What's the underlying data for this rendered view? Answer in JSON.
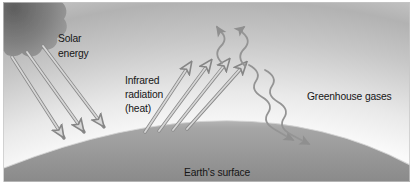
{
  "figure": {
    "type": "diagram",
    "topic": "greenhouse-effect",
    "labels": {
      "solar": [
        "Solar",
        "energy"
      ],
      "infrared": [
        "Infrared",
        "radiation",
        "(heat)"
      ],
      "greenhouse": "Greenhouse gases",
      "earth_surface": "Earth's surface"
    },
    "colors": {
      "sky_band": "#b2b2b2",
      "sky_glow": "#fafafa",
      "earth_light": "#c6c6c6",
      "earth_dark": "#898989",
      "cloud_dark": "#5e5e5e",
      "arrow_light": "#d6d6d6",
      "arrow_outline": "#8a8a8a",
      "wave_gray": "#949494",
      "text": "#161616",
      "background": "#ffffff"
    }
  }
}
